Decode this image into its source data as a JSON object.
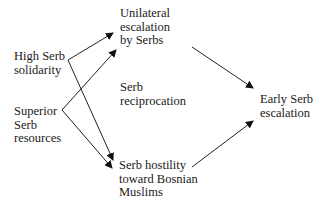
{
  "diagram": {
    "nodes": [
      {
        "id": "solidarity",
        "lines": [
          "High Serb",
          "solidarity"
        ],
        "x": 14,
        "y": 50
      },
      {
        "id": "resources",
        "lines": [
          "Superior",
          "Serb",
          "resources"
        ],
        "x": 14,
        "y": 105
      },
      {
        "id": "unilateral",
        "lines": [
          "Unilateral",
          "escalation",
          "by Serbs"
        ],
        "x": 120,
        "y": 7
      },
      {
        "id": "reciprocation",
        "lines": [
          "Serb",
          "reciprocation"
        ],
        "x": 120,
        "y": 81
      },
      {
        "id": "hostility",
        "lines": [
          "Serb hostility",
          "toward Bosnian",
          "Muslims"
        ],
        "x": 119,
        "y": 159
      },
      {
        "id": "early",
        "lines": [
          "Early Serb",
          "escalation"
        ],
        "x": 260,
        "y": 93
      }
    ],
    "edges": [
      {
        "from": "solidarity",
        "to": "unilateral",
        "x1": 68,
        "y1": 60,
        "x2": 113,
        "y2": 33
      },
      {
        "from": "solidarity",
        "to": "hostility",
        "x1": 68,
        "y1": 60,
        "x2": 113,
        "y2": 160
      },
      {
        "from": "resources",
        "to": "unilateral",
        "x1": 62,
        "y1": 110,
        "x2": 116,
        "y2": 50
      },
      {
        "from": "resources",
        "to": "hostility",
        "x1": 62,
        "y1": 110,
        "x2": 112,
        "y2": 168
      },
      {
        "from": "unilateral",
        "to": "early",
        "x1": 192,
        "y1": 47,
        "x2": 253,
        "y2": 88
      },
      {
        "from": "hostility",
        "to": "early",
        "x1": 192,
        "y1": 167,
        "x2": 253,
        "y2": 121
      }
    ]
  }
}
